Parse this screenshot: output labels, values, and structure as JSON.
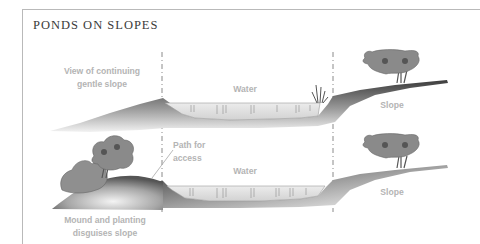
{
  "title": "PONDS ON SLOPES",
  "upper_section": {
    "left_label_line1": "View of continuing",
    "left_label_line2": "gentle slope",
    "water_label": "Water",
    "right_label": "Slope"
  },
  "lower_section": {
    "path_label_line1": "Path for",
    "path_label_line2": "access",
    "water_label": "Water",
    "right_label": "Slope",
    "bottom_label_line1": "Mound and planting",
    "bottom_label_line2": "disguises slope"
  },
  "colors": {
    "frame": "#b9b9b9",
    "title": "#3a3a3a",
    "label": "#b4b4b4",
    "ground_dark": "#3c3c3c",
    "ground_light": "#f2f2f2",
    "water": "#e3e3e3",
    "foliage": "#8a8a8a"
  }
}
